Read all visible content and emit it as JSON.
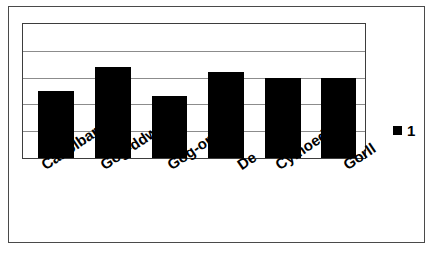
{
  "chart_data": {
    "type": "bar",
    "title": "",
    "subtitle": "",
    "xlabel": "",
    "ylabel": "",
    "categories": [
      "Canolbarth",
      "Gog-ddwy",
      "Gog-orll",
      "De",
      "Cymoedd",
      "Gorll"
    ],
    "series": [
      {
        "name": "1",
        "color": "#000000",
        "values": [
          2.5,
          3.4,
          2.3,
          3.2,
          3.0,
          3.0
        ]
      }
    ],
    "values": [
      2.5,
      3.4,
      2.3,
      3.2,
      3.0,
      3.0
    ],
    "ylim": [
      0,
      5
    ],
    "yticks": [
      0,
      1,
      2,
      3,
      4,
      5
    ],
    "ytick_labels": [],
    "xtick_labels": [
      "Canolbarth",
      "Gog-ddwy",
      "Gog-orll",
      "De",
      "Cymoedd",
      "Gorll"
    ],
    "grid": true,
    "grid_axis": "y",
    "grid_color": "#8c8c8c",
    "legend": {
      "position": "right",
      "entries": [
        {
          "label": "1",
          "color": "#000000",
          "marker": "square"
        }
      ]
    },
    "axis_frame_color": "#3d3d3d",
    "figure_border_color": "#4a4a4a",
    "background_color": "#ffffff",
    "label_rotation_degrees": -34
  },
  "legend": {
    "swatch_name": "series-1-swatch",
    "label": "1"
  },
  "bars": [
    {
      "label": "Canolbarth",
      "value": 2.5,
      "left_pct": 4.4,
      "width_pct": 10.5,
      "height_pct": 50.0
    },
    {
      "label": "Gog-ddwy",
      "value": 3.4,
      "left_pct": 21.0,
      "width_pct": 10.5,
      "height_pct": 68.0
    },
    {
      "label": "Gog-orll",
      "value": 2.3,
      "left_pct": 37.6,
      "width_pct": 10.5,
      "height_pct": 46.0
    },
    {
      "label": "De",
      "value": 3.2,
      "left_pct": 54.2,
      "width_pct": 10.5,
      "height_pct": 64.0
    },
    {
      "label": "Cymoedd",
      "value": 3.0,
      "left_pct": 70.8,
      "width_pct": 10.5,
      "height_pct": 60.0
    },
    {
      "label": "Gorll",
      "value": 3.0,
      "left_pct": 87.0,
      "width_pct": 10.5,
      "height_pct": 60.0
    }
  ],
  "gridlines": [
    {
      "top_pct": 20.0
    },
    {
      "top_pct": 40.0
    },
    {
      "top_pct": 60.0
    },
    {
      "top_pct": 80.0
    }
  ],
  "x_labels": [
    {
      "text": "Canolbarth",
      "left_px": 16
    },
    {
      "text": "Gog-ddwy",
      "left_px": 75
    },
    {
      "text": "Gog-orll",
      "left_px": 142
    },
    {
      "text": "De",
      "left_px": 212
    },
    {
      "text": "Cymoedd",
      "left_px": 250
    },
    {
      "text": "Gorll",
      "left_px": 318
    }
  ]
}
